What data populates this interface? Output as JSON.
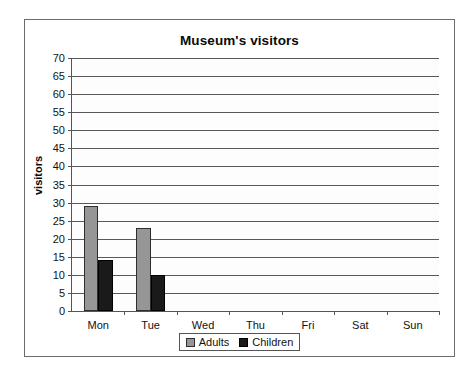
{
  "chart_data": {
    "type": "bar",
    "title": "Museum's visitors",
    "xlabel": "",
    "ylabel": "visitors",
    "categories": [
      "Mon",
      "Tue",
      "Wed",
      "Thu",
      "Fri",
      "Sat",
      "Sun"
    ],
    "series": [
      {
        "name": "Adults",
        "color": "#969696",
        "values": [
          29,
          23,
          0,
          0,
          0,
          0,
          0
        ]
      },
      {
        "name": "Children",
        "color": "#1a1a1a",
        "values": [
          14,
          10,
          0,
          0,
          0,
          0,
          0
        ]
      }
    ],
    "ylim": [
      0,
      70
    ],
    "ytick_step": 5,
    "yticks": [
      70,
      65,
      60,
      55,
      50,
      45,
      40,
      35,
      30,
      25,
      20,
      15,
      10,
      5,
      0
    ],
    "grid": true,
    "legend_position": "bottom"
  },
  "colors": {
    "frame": "#6b6b6b",
    "axis": "#555555",
    "gridline": "#595959",
    "adults": "#969696",
    "children": "#1a1a1a",
    "text": "#111111"
  }
}
